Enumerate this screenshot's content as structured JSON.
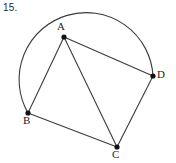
{
  "figure": {
    "problem_number": "15.",
    "stroke_color": "#3a3a42",
    "vertex_color": "#111111",
    "background_color": "#ffffff",
    "circle": {
      "center_x": 89,
      "center_y": 78,
      "radius": 67
    },
    "vertices": [
      {
        "id": "A",
        "label": "A",
        "x": 64,
        "y": 37
      },
      {
        "id": "B",
        "label": "B",
        "x": 28,
        "y": 113
      },
      {
        "id": "C",
        "label": "C",
        "x": 117,
        "y": 147
      },
      {
        "id": "D",
        "label": "D",
        "x": 153,
        "y": 76
      }
    ],
    "chords": [
      {
        "from": "A",
        "to": "B"
      },
      {
        "from": "A",
        "to": "C"
      },
      {
        "from": "A",
        "to": "D"
      },
      {
        "from": "B",
        "to": "C"
      },
      {
        "from": "C",
        "to": "D"
      }
    ],
    "arc": {
      "description": "arc from B counterclockwise through left and top to D",
      "start": "B",
      "end": "D"
    }
  }
}
